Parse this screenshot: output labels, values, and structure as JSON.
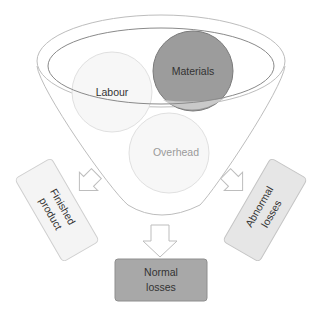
{
  "diagram": {
    "type": "funnel",
    "funnel": {
      "inputs": [
        {
          "label": "Labour",
          "fill": "#f7f7f7",
          "stroke": "#e2e2e2"
        },
        {
          "label": "Materials",
          "fill": "#9c9c9c",
          "stroke": "#7a7a7a"
        },
        {
          "label": "Overhead",
          "fill": "#f7f7f7",
          "stroke": "#e2e2e2"
        }
      ]
    },
    "outputs": [
      {
        "label_line1": "Finished",
        "label_line2": "product",
        "fill": "#f4f4f4",
        "direction": "left"
      },
      {
        "label_line1": "Normal",
        "label_line2": "losses",
        "fill": "#a8a8a8",
        "direction": "down"
      },
      {
        "label_line1": "Abnormal",
        "label_line2": "losses",
        "fill": "#e6e6e6",
        "direction": "right"
      }
    ],
    "colors": {
      "outline": "#b5b5b5",
      "inner_outline": "#8a8a8a",
      "text_dark": "#333333",
      "text_light": "#9a9a9a"
    }
  }
}
